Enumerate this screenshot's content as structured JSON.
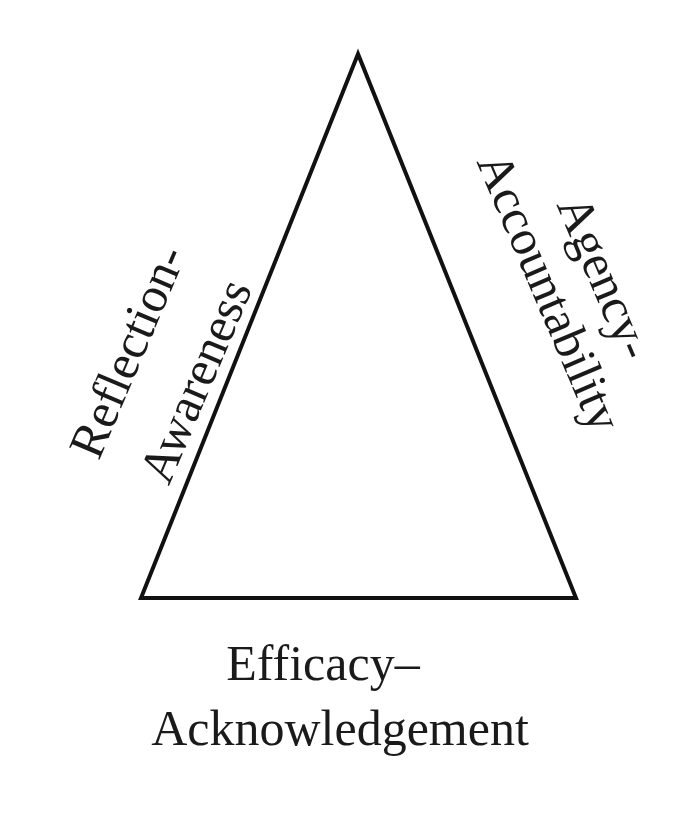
{
  "diagram": {
    "type": "triangle",
    "stroke_color": "#111111",
    "vertices": {
      "top": [
        358,
        54
      ],
      "bottom_left": [
        141,
        598
      ],
      "bottom_right": [
        576,
        598
      ]
    },
    "labels": {
      "left_side": {
        "line1": "Reflection-",
        "line2": "Awareness"
      },
      "right_side": {
        "line1": "Agency-",
        "line2": "Accountability"
      },
      "bottom_side": {
        "line1": "Efficacy–",
        "line2": "Acknowledgement"
      }
    }
  }
}
